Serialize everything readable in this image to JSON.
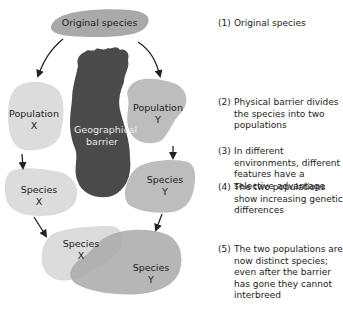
{
  "diagram": {
    "type": "allopatric-speciation-flow",
    "nodes": {
      "original": "Original species",
      "barrier_line1": "Geographical",
      "barrier_line2": "barrier",
      "pop_x_line1": "Population",
      "pop_x_line2": "X",
      "pop_y_line1": "Population",
      "pop_y_line2": "Y",
      "species_x_line1": "Species",
      "species_x_line2": "X",
      "species_y_line1": "Species",
      "species_y_line2": "Y",
      "final_x_line1": "Species",
      "final_x_line2": "X",
      "final_y_line1": "Species",
      "final_y_line2": "Y"
    },
    "colors": {
      "original": "#a9a9a9",
      "barrier": "#4a4a4a",
      "pop_x": "#dcdcdc",
      "pop_y": "#bdbdbd",
      "arrow": "#222222"
    }
  },
  "steps": [
    {
      "num": "(1)",
      "text": "Original species"
    },
    {
      "num": "(2)",
      "text": "Physical barrier divides the species into two populations"
    },
    {
      "num": "(3)",
      "text": "In different environments, different features have a selective advantage"
    },
    {
      "num": "(4)",
      "text": "The two populations show increasing genetic differences"
    },
    {
      "num": "(5)",
      "text": "The two populations are now distinct species; even after the barrier has gone they cannot interbreed"
    }
  ]
}
